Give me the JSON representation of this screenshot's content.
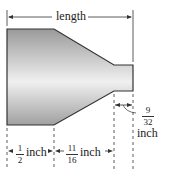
{
  "diagram": {
    "labels": {
      "length": "length",
      "left_section": {
        "num": "1",
        "den": "2",
        "unit": "inch"
      },
      "taper_section": {
        "num": "11",
        "den": "16",
        "unit": "inch"
      },
      "narrow_section": {
        "num": "9",
        "den": "32",
        "unit": "inch"
      }
    },
    "colors": {
      "outline": "#333333",
      "fill_dark": "#9a9a9a",
      "fill_light": "#f2f2f2"
    }
  }
}
